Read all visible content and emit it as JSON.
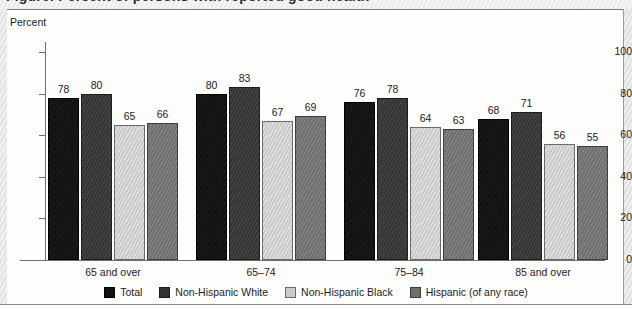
{
  "axis_unit_label": "Percent",
  "chart_data": {
    "type": "bar",
    "title": "",
    "xlabel": "",
    "ylabel": "Percent",
    "ylim": [
      0,
      100
    ],
    "yticks": [
      0,
      20,
      40,
      60,
      80,
      100
    ],
    "grid": false,
    "legend_position": "bottom",
    "categories": [
      "65 and over",
      "65–74",
      "75–84",
      "85 and over"
    ],
    "series": [
      {
        "name": "Total",
        "values": [
          78,
          80,
          76,
          68
        ],
        "color": "#111111"
      },
      {
        "name": "Non-Hispanic White",
        "values": [
          80,
          83,
          78,
          71
        ],
        "color": "#343434"
      },
      {
        "name": "Non-Hispanic Black",
        "values": [
          65,
          67,
          64,
          56
        ],
        "color": "#c9c9c9"
      },
      {
        "name": "Hispanic (of any race)",
        "values": [
          66,
          69,
          63,
          55
        ],
        "color": "#6f6f6f"
      }
    ]
  },
  "ytick_labels": [
    "0",
    "20",
    "40",
    "60",
    "80",
    "100"
  ],
  "groups": [
    {
      "label": "65 and over",
      "values": [
        "78",
        "80",
        "65",
        "66"
      ]
    },
    {
      "label": "65–74",
      "values": [
        "80",
        "83",
        "67",
        "69"
      ]
    },
    {
      "label": "75–84",
      "values": [
        "76",
        "78",
        "64",
        "63"
      ]
    },
    {
      "label": "85 and over",
      "values": [
        "68",
        "71",
        "56",
        "55"
      ]
    }
  ],
  "legend": {
    "items": [
      {
        "label": "Total"
      },
      {
        "label": "Non-Hispanic White"
      },
      {
        "label": "Non-Hispanic Black"
      },
      {
        "label": "Hispanic (of any race)"
      }
    ]
  }
}
